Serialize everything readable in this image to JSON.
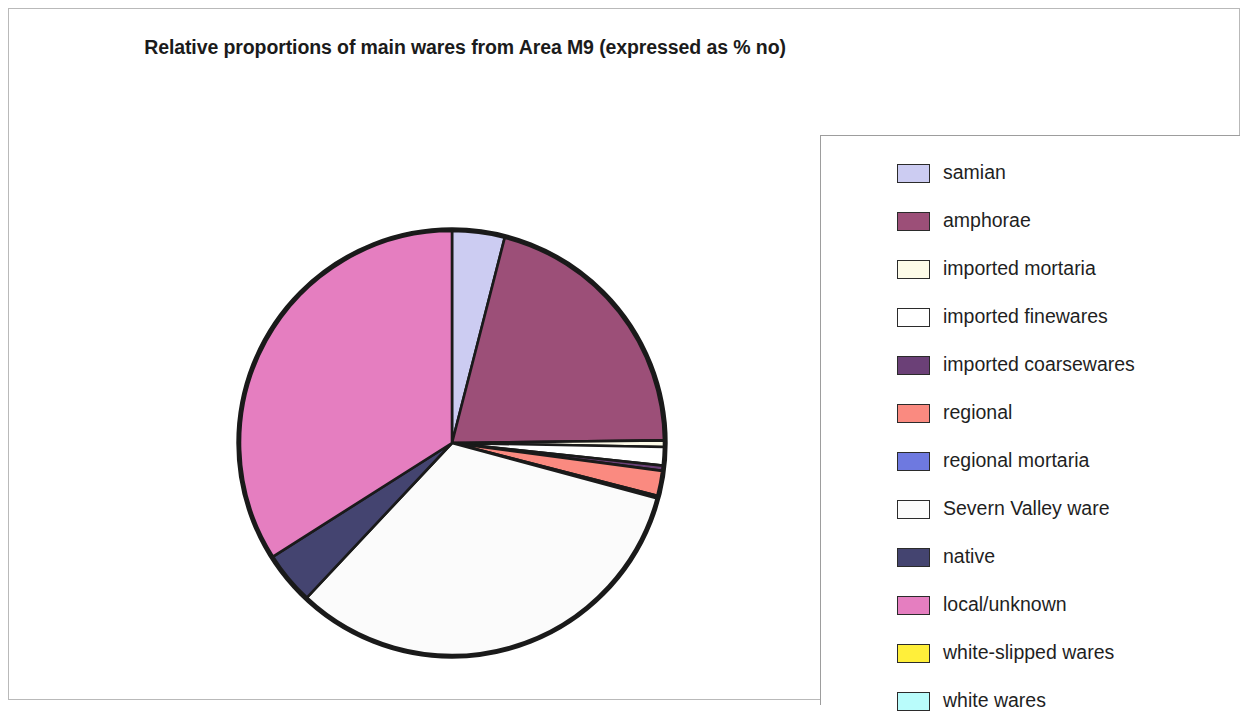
{
  "chart_title": "Relative proportions of main wares from Area M9 (expressed as % no)",
  "legend": {
    "items": [
      {
        "label": "samian",
        "color": "#ccccf2"
      },
      {
        "label": "amphorae",
        "color": "#9c4f78"
      },
      {
        "label": "imported mortaria",
        "color": "#fdfbe8"
      },
      {
        "label": "imported finewares",
        "color": "#ffffff"
      },
      {
        "label": "imported coarsewares",
        "color": "#6b4077"
      },
      {
        "label": "regional",
        "color": "#fa8a80"
      },
      {
        "label": "regional mortaria",
        "color": "#6e79e0"
      },
      {
        "label": "Severn Valley ware",
        "color": "#fbfbfb"
      },
      {
        "label": "native",
        "color": "#444470"
      },
      {
        "label": "local/unknown",
        "color": "#e57ec0"
      },
      {
        "label": "white-slipped wares",
        "color": "#ffef3a"
      },
      {
        "label": "white wares",
        "color": "#b9fcfb"
      }
    ]
  },
  "chart_data": {
    "type": "pie",
    "title": "Relative proportions of main wares from Area M9 (expressed as % no)",
    "unit": "% no",
    "legend_position": "right",
    "start_angle_deg": 0,
    "direction": "clockwise",
    "categories": [
      "samian",
      "amphorae",
      "imported mortaria",
      "imported finewares",
      "imported coarsewares",
      "regional",
      "regional mortaria",
      "Severn Valley ware",
      "native",
      "local/unknown",
      "white-slipped wares",
      "white wares"
    ],
    "values": [
      4.0,
      20.8,
      0.5,
      1.4,
      0.4,
      1.9,
      0.2,
      32.8,
      4.0,
      34.0,
      0.0,
      0.0
    ],
    "colors": [
      "#ccccf2",
      "#9c4f78",
      "#fdfbe8",
      "#ffffff",
      "#6b4077",
      "#fa8a80",
      "#6e79e0",
      "#fbfbfb",
      "#444470",
      "#e57ec0",
      "#ffef3a",
      "#b9fcfb"
    ],
    "slice_border_color": "#1a1a1a",
    "xlabel": "",
    "ylabel": ""
  }
}
